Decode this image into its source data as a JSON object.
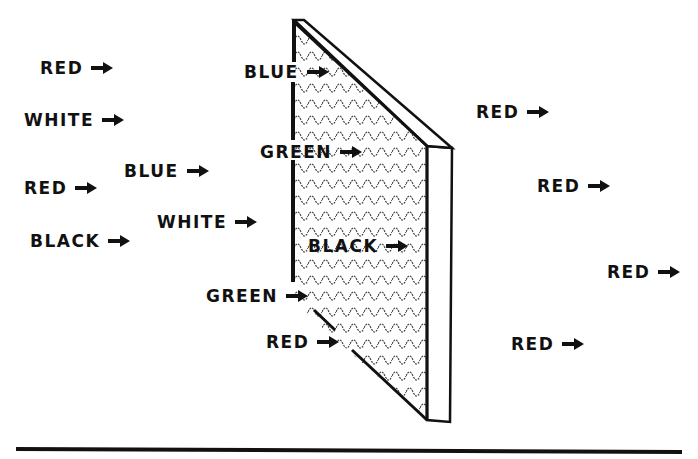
{
  "diagram": {
    "title": "",
    "filter": {
      "name": "filter",
      "pattern": "wavy-texture"
    },
    "incoming_rays": [
      {
        "label": "RED"
      },
      {
        "label": "WHITE"
      },
      {
        "label": "RED"
      },
      {
        "label": "BLACK"
      },
      {
        "label": "BLUE"
      },
      {
        "label": "WHITE"
      },
      {
        "label": "BLUE"
      },
      {
        "label": "GREEN"
      },
      {
        "label": "BLACK"
      },
      {
        "label": "GREEN"
      },
      {
        "label": "RED"
      }
    ],
    "outgoing_rays": [
      {
        "label": "RED"
      },
      {
        "label": "RED"
      },
      {
        "label": "RED"
      },
      {
        "label": "RED"
      }
    ],
    "icons": {
      "arrow": "right-arrow-icon"
    },
    "colors": {
      "ink": "#111111",
      "background": "#ffffff"
    }
  }
}
